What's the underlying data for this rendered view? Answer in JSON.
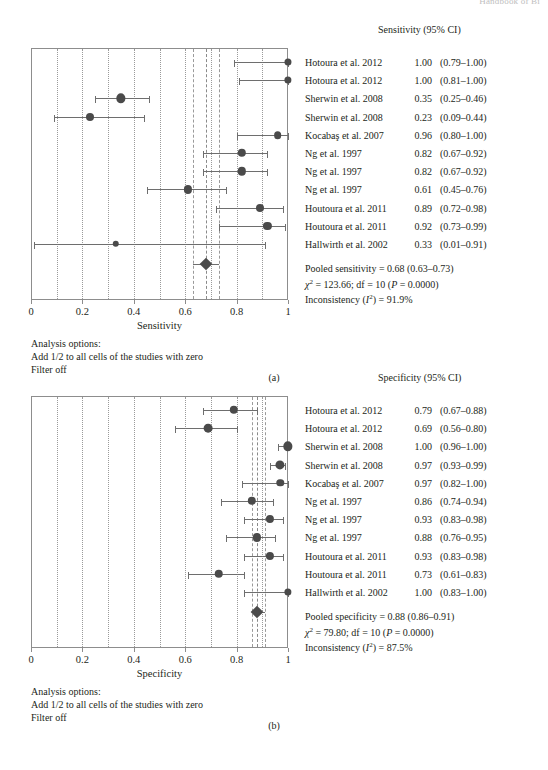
{
  "page_header": "Handbook of Bi",
  "chart_data": [
    {
      "type": "forest",
      "id": "a",
      "caption": "(a)",
      "column_header": "Sensitivity (95% CI)",
      "xlabel": "Sensitivity",
      "xlim": [
        0,
        1
      ],
      "xticks": [
        0,
        0.2,
        0.4,
        0.6,
        0.8,
        1
      ],
      "xticklabels": [
        "0",
        "0.2",
        "0.4",
        "0.6",
        "0.8",
        "1"
      ],
      "gridlines": [
        0.1,
        0.2,
        0.3,
        0.4,
        0.5,
        0.6,
        0.7,
        0.8,
        0.9
      ],
      "grid": true,
      "studies": [
        {
          "name": "Hotoura et al. 2012",
          "estimate": 1.0,
          "low": 0.79,
          "high": 1.0,
          "est_text": "1.00",
          "ci_text": "(0.79–1.00)",
          "weight": 3.2
        },
        {
          "name": "Hotoura et al. 2012",
          "estimate": 1.0,
          "low": 0.81,
          "high": 1.0,
          "est_text": "1.00",
          "ci_text": "(0.81–1.00)",
          "weight": 3.4
        },
        {
          "name": "Sherwin et al. 2008",
          "estimate": 0.35,
          "low": 0.25,
          "high": 0.46,
          "est_text": "0.35",
          "ci_text": "(0.25–0.46)",
          "weight": 5.6
        },
        {
          "name": "Sherwin et al. 2008",
          "estimate": 0.23,
          "low": 0.09,
          "high": 0.44,
          "est_text": "0.23",
          "ci_text": "(0.09–0.44)",
          "weight": 4.2
        },
        {
          "name": "Kocabaş et al. 2007",
          "estimate": 0.96,
          "low": 0.8,
          "high": 1.0,
          "est_text": "0.96",
          "ci_text": "(0.80–1.00)",
          "weight": 3.9
        },
        {
          "name": "Ng et al. 1997",
          "estimate": 0.82,
          "low": 0.67,
          "high": 0.92,
          "est_text": "0.82",
          "ci_text": "(0.67–0.92)",
          "weight": 4.6
        },
        {
          "name": "Ng et al. 1997",
          "estimate": 0.82,
          "low": 0.67,
          "high": 0.92,
          "est_text": "0.82",
          "ci_text": "(0.67–0.92)",
          "weight": 4.6
        },
        {
          "name": "Ng et al. 1997",
          "estimate": 0.61,
          "low": 0.45,
          "high": 0.76,
          "est_text": "0.61",
          "ci_text": "(0.45–0.76)",
          "weight": 4.4
        },
        {
          "name": "Houtoura et al. 2011",
          "estimate": 0.89,
          "low": 0.72,
          "high": 0.98,
          "est_text": "0.89",
          "ci_text": "(0.72–0.98)",
          "weight": 4.2
        },
        {
          "name": "Houtoura et al. 2011",
          "estimate": 0.92,
          "low": 0.73,
          "high": 0.99,
          "est_text": "0.92",
          "ci_text": "(0.73–0.99)",
          "weight": 4.4
        },
        {
          "name": "Hallwirth et al. 2002",
          "estimate": 0.33,
          "low": 0.01,
          "high": 0.91,
          "est_text": "0.33",
          "ci_text": "(0.01–0.91)",
          "weight": 2.6
        }
      ],
      "pooled": {
        "estimate": 0.68,
        "low": 0.63,
        "high": 0.73
      },
      "pooled_text": "Pooled sensitivity = 0.68 (0.63–0.73)",
      "chi_text_pre": "χ",
      "chi_text": " = 123.66; df = 10 (",
      "chi_p": "P",
      "chi_text_post": " = 0.0000)",
      "inconsistency_pre": "Inconsistency (",
      "inconsistency_i": "I",
      "inconsistency_post": ") = 91.9%",
      "options_title": "Analysis options:",
      "options_lines": [
        "Add 1/2 to all cells of the studies with zero",
        "Filter off"
      ]
    },
    {
      "type": "forest",
      "id": "b",
      "caption": "(b)",
      "column_header": "Specificity (95% CI)",
      "xlabel": "Specificity",
      "xlim": [
        0,
        1
      ],
      "xticks": [
        0,
        0.2,
        0.4,
        0.6,
        0.8,
        1
      ],
      "xticklabels": [
        "0",
        "0.2",
        "0.4",
        "0.6",
        "0.8",
        "1"
      ],
      "gridlines": [
        0.1,
        0.2,
        0.3,
        0.4,
        0.5,
        0.6,
        0.7,
        0.8,
        0.9
      ],
      "grid": true,
      "studies": [
        {
          "name": "Hotoura et al. 2012",
          "estimate": 0.79,
          "low": 0.67,
          "high": 0.88,
          "est_text": "0.79",
          "ci_text": "(0.67–0.88)",
          "weight": 4.6
        },
        {
          "name": "Hotoura et al. 2012",
          "estimate": 0.69,
          "low": 0.56,
          "high": 0.8,
          "est_text": "0.69",
          "ci_text": "(0.56–0.80)",
          "weight": 5.0
        },
        {
          "name": "Sherwin et al. 2008",
          "estimate": 1.0,
          "low": 0.96,
          "high": 1.0,
          "est_text": "1.00",
          "ci_text": "(0.96–1.00)",
          "weight": 5.6
        },
        {
          "name": "Sherwin et al. 2008",
          "estimate": 0.97,
          "low": 0.93,
          "high": 0.99,
          "est_text": "0.97",
          "ci_text": "(0.93–0.99)",
          "weight": 5.4
        },
        {
          "name": "Kocabaş et al. 2007",
          "estimate": 0.97,
          "low": 0.82,
          "high": 1.0,
          "est_text": "0.97",
          "ci_text": "(0.82–1.00)",
          "weight": 3.6
        },
        {
          "name": "Ng et al. 1997",
          "estimate": 0.86,
          "low": 0.74,
          "high": 0.94,
          "est_text": "0.86",
          "ci_text": "(0.74–0.94)",
          "weight": 4.6
        },
        {
          "name": "Ng et al. 1997",
          "estimate": 0.93,
          "low": 0.83,
          "high": 0.98,
          "est_text": "0.93",
          "ci_text": "(0.83–0.98)",
          "weight": 4.4
        },
        {
          "name": "Ng et al. 1997",
          "estimate": 0.88,
          "low": 0.76,
          "high": 0.95,
          "est_text": "0.88",
          "ci_text": "(0.76–0.95)",
          "weight": 4.4
        },
        {
          "name": "Houtoura et al. 2011",
          "estimate": 0.93,
          "low": 0.83,
          "high": 0.98,
          "est_text": "0.93",
          "ci_text": "(0.83–0.98)",
          "weight": 4.4
        },
        {
          "name": "Houtoura et al. 2011",
          "estimate": 0.73,
          "low": 0.61,
          "high": 0.83,
          "est_text": "0.73",
          "ci_text": "(0.61–0.83)",
          "weight": 4.8
        },
        {
          "name": "Hallwirth et al. 2002",
          "estimate": 1.0,
          "low": 0.83,
          "high": 1.0,
          "est_text": "1.00",
          "ci_text": "(0.83–1.00)",
          "weight": 3.4
        }
      ],
      "pooled": {
        "estimate": 0.88,
        "low": 0.86,
        "high": 0.91
      },
      "pooled_text": "Pooled specificity = 0.88 (0.86–0.91)",
      "chi_text_pre": "χ",
      "chi_text": " = 79.80; df = 10 (",
      "chi_p": "P",
      "chi_text_post": " = 0.0000)",
      "inconsistency_pre": "Inconsistency (",
      "inconsistency_i": "I",
      "inconsistency_post": ") = 87.5%",
      "options_title": "Analysis options:",
      "options_lines": [
        "Add 1/2 to all cells of the studies with zero",
        "Filter off"
      ]
    }
  ],
  "colors": {
    "marker": "#4a4a4a",
    "line": "#6e6e6e",
    "frame": "#8d8d8d",
    "grid": "#9a9a9a",
    "text": "#231f20"
  }
}
